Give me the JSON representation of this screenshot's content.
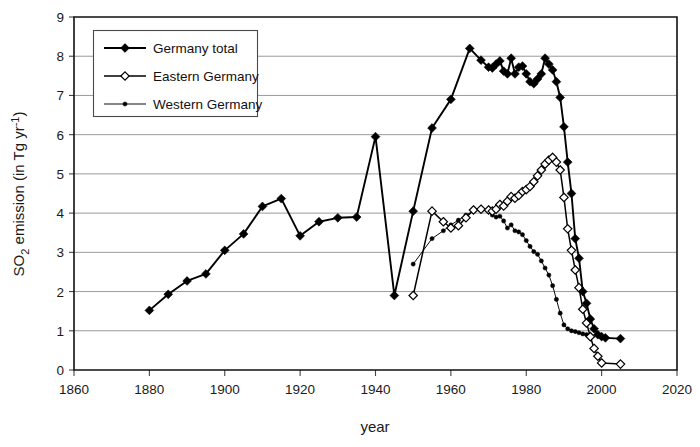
{
  "chart_data": {
    "type": "line",
    "title": "",
    "xlabel": "year",
    "ylabel": "SO2 emission (in Tg yr-1)",
    "ylabel_parts": {
      "pre": "SO",
      "sub": "2",
      "mid": " emission (in Tg yr",
      "sup": "-1",
      "post": ")"
    },
    "xlim": [
      1860,
      2020
    ],
    "ylim": [
      0,
      9
    ],
    "xticks": [
      1860,
      1880,
      1900,
      1920,
      1940,
      1960,
      1980,
      2000,
      2020
    ],
    "yticks": [
      0,
      1,
      2,
      3,
      4,
      5,
      6,
      7,
      8,
      9
    ],
    "grid": "horizontal",
    "legend_position": "top-left-inside",
    "series": [
      {
        "name": "Germany total",
        "marker": "filled-diamond",
        "color": "#000000",
        "points": [
          [
            1880,
            1.52
          ],
          [
            1885,
            1.93
          ],
          [
            1890,
            2.27
          ],
          [
            1895,
            2.45
          ],
          [
            1900,
            3.05
          ],
          [
            1905,
            3.47
          ],
          [
            1910,
            4.17
          ],
          [
            1915,
            4.37
          ],
          [
            1920,
            3.42
          ],
          [
            1925,
            3.78
          ],
          [
            1930,
            3.88
          ],
          [
            1935,
            3.9
          ],
          [
            1940,
            5.95
          ],
          [
            1945,
            1.9
          ],
          [
            1950,
            4.05
          ],
          [
            1955,
            6.17
          ],
          [
            1960,
            6.9
          ],
          [
            1965,
            8.2
          ],
          [
            1968,
            7.9
          ],
          [
            1970,
            7.72
          ],
          [
            1971,
            7.7
          ],
          [
            1972,
            7.8
          ],
          [
            1973,
            7.88
          ],
          [
            1974,
            7.62
          ],
          [
            1975,
            7.55
          ],
          [
            1976,
            7.95
          ],
          [
            1977,
            7.55
          ],
          [
            1978,
            7.72
          ],
          [
            1979,
            7.75
          ],
          [
            1980,
            7.55
          ],
          [
            1981,
            7.35
          ],
          [
            1982,
            7.3
          ],
          [
            1983,
            7.42
          ],
          [
            1984,
            7.55
          ],
          [
            1985,
            7.95
          ],
          [
            1986,
            7.8
          ],
          [
            1987,
            7.65
          ],
          [
            1988,
            7.35
          ],
          [
            1989,
            6.95
          ],
          [
            1990,
            6.2
          ],
          [
            1991,
            5.3
          ],
          [
            1992,
            4.5
          ],
          [
            1993,
            3.35
          ],
          [
            1994,
            2.85
          ],
          [
            1995,
            2.0
          ],
          [
            1996,
            1.7
          ],
          [
            1997,
            1.3
          ],
          [
            1998,
            1.05
          ],
          [
            1999,
            0.9
          ],
          [
            2000,
            0.85
          ],
          [
            2001,
            0.82
          ],
          [
            2005,
            0.8
          ]
        ]
      },
      {
        "name": "Eastern Germany",
        "marker": "open-diamond",
        "color": "#000000",
        "points": [
          [
            1950,
            1.9
          ],
          [
            1955,
            4.05
          ],
          [
            1958,
            3.78
          ],
          [
            1960,
            3.62
          ],
          [
            1962,
            3.68
          ],
          [
            1964,
            3.88
          ],
          [
            1966,
            4.08
          ],
          [
            1968,
            4.1
          ],
          [
            1970,
            4.08
          ],
          [
            1971,
            4.05
          ],
          [
            1972,
            4.1
          ],
          [
            1973,
            4.22
          ],
          [
            1974,
            4.18
          ],
          [
            1975,
            4.3
          ],
          [
            1976,
            4.42
          ],
          [
            1977,
            4.38
          ],
          [
            1978,
            4.45
          ],
          [
            1979,
            4.55
          ],
          [
            1980,
            4.6
          ],
          [
            1981,
            4.68
          ],
          [
            1982,
            4.8
          ],
          [
            1983,
            4.95
          ],
          [
            1984,
            5.1
          ],
          [
            1985,
            5.25
          ],
          [
            1986,
            5.35
          ],
          [
            1987,
            5.42
          ],
          [
            1988,
            5.3
          ],
          [
            1989,
            5.1
          ],
          [
            1990,
            4.4
          ],
          [
            1991,
            3.6
          ],
          [
            1992,
            3.05
          ],
          [
            1993,
            2.55
          ],
          [
            1994,
            2.1
          ],
          [
            1995,
            1.55
          ],
          [
            1996,
            1.2
          ],
          [
            1997,
            0.85
          ],
          [
            1998,
            0.55
          ],
          [
            1999,
            0.35
          ],
          [
            2000,
            0.18
          ],
          [
            2005,
            0.15
          ]
        ]
      },
      {
        "name": "Western Germany",
        "marker": "small-filled-dot",
        "color": "#000000",
        "points": [
          [
            1950,
            2.7
          ],
          [
            1955,
            3.35
          ],
          [
            1958,
            3.55
          ],
          [
            1960,
            3.7
          ],
          [
            1962,
            3.82
          ],
          [
            1964,
            3.95
          ],
          [
            1966,
            4.05
          ],
          [
            1968,
            4.08
          ],
          [
            1970,
            4.05
          ],
          [
            1971,
            3.95
          ],
          [
            1972,
            3.9
          ],
          [
            1973,
            3.92
          ],
          [
            1974,
            3.8
          ],
          [
            1975,
            3.62
          ],
          [
            1976,
            3.7
          ],
          [
            1977,
            3.55
          ],
          [
            1978,
            3.52
          ],
          [
            1979,
            3.45
          ],
          [
            1980,
            3.3
          ],
          [
            1981,
            3.15
          ],
          [
            1982,
            3.02
          ],
          [
            1983,
            2.95
          ],
          [
            1984,
            2.78
          ],
          [
            1985,
            2.6
          ],
          [
            1986,
            2.42
          ],
          [
            1987,
            2.15
          ],
          [
            1988,
            1.8
          ],
          [
            1989,
            1.45
          ],
          [
            1990,
            1.15
          ],
          [
            1991,
            1.05
          ],
          [
            1992,
            1.0
          ],
          [
            1993,
            0.98
          ],
          [
            1994,
            0.95
          ],
          [
            1995,
            0.92
          ],
          [
            1996,
            0.9
          ],
          [
            1997,
            0.88
          ]
        ]
      }
    ]
  },
  "legend": {
    "entries": [
      {
        "label": "Germany total",
        "marker": "filled-diamond"
      },
      {
        "label": "Eastern Germany",
        "marker": "open-diamond"
      },
      {
        "label": "Western Germany",
        "marker": "small-filled-dot"
      }
    ]
  },
  "colors": {
    "line": "#000000",
    "grid": "#8f8f8f",
    "axis": "#111111",
    "background": "#ffffff"
  }
}
